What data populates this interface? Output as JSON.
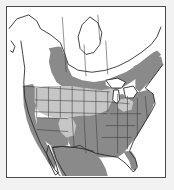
{
  "figure": {
    "frame_color": "#4a4a4a",
    "background_color": "#f2f2f2",
    "map_background_color": "#ffffff"
  },
  "legend_colors": {
    "heavy_shading": "#8a8a8a",
    "light_shading": "#c6c6c6",
    "no_shading": "#ffffff",
    "outline": "#2b2b2b",
    "subdivision_line": "#3a3a3a"
  },
  "map": {
    "projection_extent": "North America, Alaska to southern Mexico",
    "regions": [
      {
        "name": "alaska",
        "label": "Alaska",
        "shading": "none"
      },
      {
        "name": "yukon-nwt-nunavut",
        "label": "Northern Canada",
        "shading": "none"
      },
      {
        "name": "british-columbia",
        "label": "British Columbia",
        "shading": "none"
      },
      {
        "name": "prairie-provinces",
        "label": "Alberta / Saskatchewan / Manitoba",
        "shading": "heavy"
      },
      {
        "name": "ontario-quebec-north",
        "label": "Northern Ontario and Quebec",
        "shading": "none"
      },
      {
        "name": "southern-ontario-quebec",
        "label": "Southern Ontario and Quebec",
        "shading": "heavy"
      },
      {
        "name": "maritimes",
        "label": "Atlantic Canada",
        "shading": "heavy"
      },
      {
        "name": "pacific-coast-states",
        "label": "Washington / Oregon / California",
        "shading": "heavy"
      },
      {
        "name": "interior-west",
        "label": "Nevada / Utah / Colorado / Wyoming",
        "shading": "light"
      },
      {
        "name": "great-plains",
        "label": "Dakotas / Nebraska / Kansas",
        "shading": "light"
      },
      {
        "name": "southwest",
        "label": "Arizona / New Mexico",
        "shading": "heavy"
      },
      {
        "name": "midwest-east",
        "label": "Midwest and Eastern United States",
        "shading": "heavy"
      },
      {
        "name": "southeast",
        "label": "Southeastern United States and Florida",
        "shading": "heavy"
      },
      {
        "name": "mexico",
        "label": "Mexico",
        "shading": "heavy"
      },
      {
        "name": "great-lakes",
        "label": "Great Lakes",
        "shading": "water"
      }
    ]
  }
}
